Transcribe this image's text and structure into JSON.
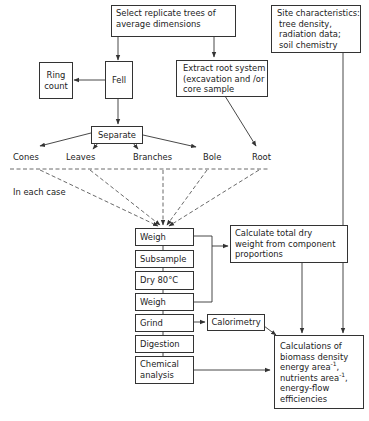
{
  "diagram": {
    "nodes": {
      "select": "Select replicate trees of average dimensions",
      "select_l1": "Select replicate trees of",
      "select_l2": "average dimensions",
      "site": "Site characteristics: tree density, radiation data; soil chemistry",
      "site_l1": "Site characteristics:",
      "site_l2": "tree density,",
      "site_l3": "radiation data;",
      "site_l4": "soil chemistry",
      "ring_l1": "Ring",
      "ring_l2": "count",
      "fell": "Fell",
      "extract_l1": "Extract root system",
      "extract_l2": "(excavation and /or",
      "extract_l3": "core sample",
      "separate": "Separate",
      "weigh1": "Weigh",
      "subsample": "Subsample",
      "dry": "Dry 80°C",
      "weigh2": "Weigh",
      "grind": "Grind",
      "digestion": "Digestion",
      "chem_l1": "Chemical",
      "chem_l2": "analysis",
      "calc_l1": "Calculate total dry",
      "calc_l2": "weight from component",
      "calc_l3": "proportions",
      "calorimetry": "Calorimetry",
      "final_l1": "Calculations of",
      "final_l2": "biomass density",
      "final_l3a": "energy area",
      "final_l3b": "-1",
      "final_l3c": ",",
      "final_l4a": "nutrients area",
      "final_l4b": "-1",
      "final_l4c": ",",
      "final_l5": "energy-flow",
      "final_l6": "efficiencies"
    },
    "components": [
      "Cones",
      "Leaves",
      "Branches",
      "Bole",
      "Root"
    ],
    "annotation": "In each case"
  }
}
